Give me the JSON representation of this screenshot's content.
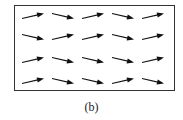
{
  "caption": "(b)",
  "chart_data": {
    "type": "vector-field",
    "rows": 4,
    "cols": 5,
    "arrow_color": "#111111",
    "directions": [
      [
        "up-right",
        "down-right",
        "up-right",
        "down-right",
        "up-right"
      ],
      [
        "down-right",
        "up-right",
        "up-right",
        "down-right",
        "up-right"
      ],
      [
        "up-right",
        "down-right",
        "down-right",
        "down-right",
        "up-right"
      ],
      [
        "up-right",
        "down-right",
        "down-right",
        "up-right",
        "down-right"
      ]
    ]
  }
}
